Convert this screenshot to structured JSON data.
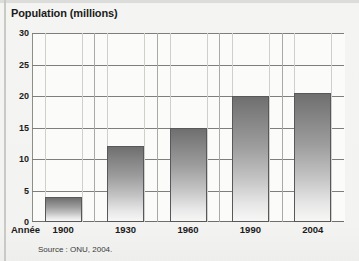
{
  "chart_data": {
    "type": "bar",
    "title": "Population (millions)",
    "xlabel": "Année",
    "ylabel": "",
    "categories": [
      "1900",
      "1930",
      "1960",
      "1990",
      "2004"
    ],
    "values": [
      4,
      12,
      15,
      20,
      20.5
    ],
    "ylim": [
      0,
      30
    ],
    "yticks": [
      "0",
      "5",
      "10",
      "15",
      "20",
      "25",
      "30"
    ],
    "ytick_values": [
      0,
      5,
      10,
      15,
      20,
      25,
      30
    ],
    "grid": true,
    "legend": "none",
    "source": "Source : ONU, 2004.",
    "series": [
      {
        "name": "Population (millions)",
        "values": [
          4,
          12,
          15,
          20,
          20.5
        ]
      }
    ]
  },
  "colors": {
    "bar_top": "#6f6f6f",
    "bar_bottom": "#f7f7f6",
    "bar_border": "#58585a",
    "gridline": "#7e7e7b",
    "axis": "#8d8d8a",
    "background": "#f2f2f0",
    "plot_background": "#fbfbfa",
    "text": "#1b1b1b"
  }
}
